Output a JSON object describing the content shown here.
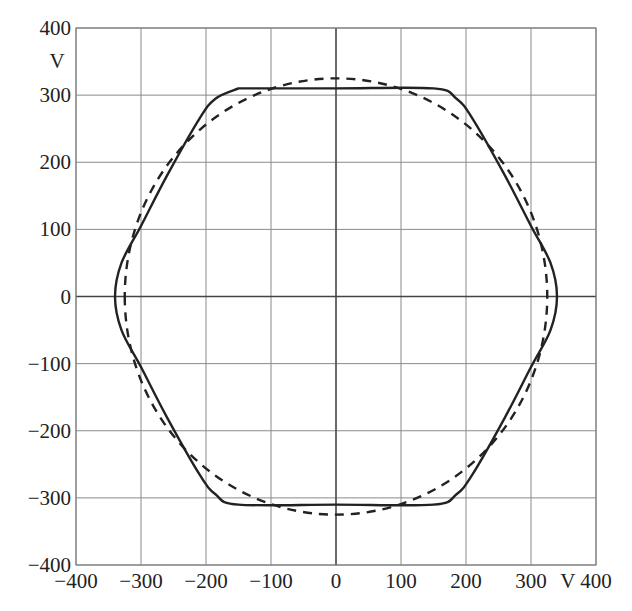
{
  "chart_data": {
    "type": "line",
    "title": "",
    "xlabel": "V",
    "ylabel": "V",
    "xlim": [
      -400,
      400
    ],
    "ylim": [
      -400,
      400
    ],
    "grid": true,
    "x_ticks": [
      -400,
      -300,
      -200,
      -100,
      0,
      100,
      200,
      300,
      400
    ],
    "y_ticks": [
      -400,
      -300,
      -200,
      -100,
      0,
      100,
      200,
      300,
      400
    ],
    "x_tick_labels": [
      "−400",
      "−300",
      "−200",
      "−100",
      "0",
      "100",
      "200",
      "300",
      "V 400"
    ],
    "y_tick_labels": [
      "−400",
      "−300",
      "−200",
      "−100",
      "0",
      "100",
      "200",
      "300",
      "400"
    ],
    "x_unit_label": "V",
    "y_unit_label": "V",
    "legend": [],
    "series": [
      {
        "name": "voltage space vector trajectory (hexagon, rounded corners)",
        "style": "solid",
        "color": "#222222",
        "points": [
          [
            -150,
            310
          ],
          [
            0,
            310
          ],
          [
            150,
            310
          ],
          [
            185,
            295
          ],
          [
            210,
            265
          ],
          [
            260,
            180
          ],
          [
            300,
            105
          ],
          [
            330,
            50
          ],
          [
            340,
            0
          ],
          [
            330,
            -50
          ],
          [
            300,
            -105
          ],
          [
            260,
            -180
          ],
          [
            210,
            -265
          ],
          [
            185,
            -295
          ],
          [
            150,
            -310
          ],
          [
            0,
            -310
          ],
          [
            -150,
            -310
          ],
          [
            -185,
            -295
          ],
          [
            -210,
            -265
          ],
          [
            -260,
            -180
          ],
          [
            -300,
            -105
          ],
          [
            -330,
            -50
          ],
          [
            -340,
            0
          ],
          [
            -330,
            50
          ],
          [
            -300,
            105
          ],
          [
            -260,
            180
          ],
          [
            -210,
            265
          ],
          [
            -185,
            295
          ],
          [
            -150,
            310
          ]
        ]
      },
      {
        "name": "circular reference trajectory",
        "style": "dashed",
        "color": "#222222",
        "shape": "circle",
        "radius": 325,
        "center": [
          0,
          0
        ]
      }
    ]
  },
  "axes": {
    "y_unit": "V",
    "x_unit": "V"
  }
}
